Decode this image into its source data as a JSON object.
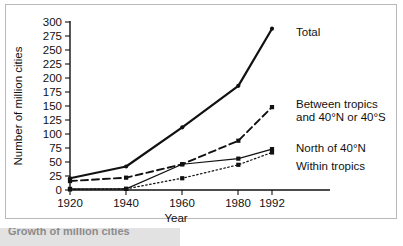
{
  "figure": {
    "caption_partial": "Growth of million cities",
    "frame_color": "#b9b9b9",
    "background": "#ffffff",
    "ink_color": "#111111"
  },
  "chart_data": {
    "type": "line",
    "title": "",
    "xlabel": "Year",
    "ylabel": "Number of million cities",
    "x": [
      1920,
      1940,
      1960,
      1980,
      1992
    ],
    "categories": [
      "1920",
      "1940",
      "1960",
      "1980",
      "1992"
    ],
    "xlim": [
      1920,
      1992
    ],
    "ylim": [
      0,
      300
    ],
    "yticks": [
      0,
      25,
      50,
      75,
      100,
      125,
      150,
      175,
      200,
      225,
      250,
      275,
      300
    ],
    "ytick_labels": [
      "0",
      "25",
      "50",
      "75",
      "100",
      "125",
      "150",
      "175",
      "200",
      "225",
      "250",
      "275",
      "300"
    ],
    "xticks": [
      1920,
      1940,
      1960,
      1980,
      1992
    ],
    "xtick_labels": [
      "1920",
      "1940",
      "1960",
      "1980",
      "1992"
    ],
    "grid": false,
    "legend": "inline-right-labels",
    "series": [
      {
        "name": "Total",
        "label": "Total",
        "style": "solid-thick",
        "marker": "dot",
        "values": [
          21,
          42,
          112,
          186,
          288
        ]
      },
      {
        "name": "Between tropics and 40°N or 40°S",
        "label_line1": "Between tropics",
        "label_line2": "and 40°N or 40°S",
        "style": "dashed",
        "marker": "square",
        "values": [
          16,
          22,
          46,
          88,
          148
        ]
      },
      {
        "name": "North of 40°N",
        "label": "North of 40°N",
        "style": "solid-thin",
        "marker": "square",
        "values": [
          2,
          2,
          46,
          56,
          73
        ]
      },
      {
        "name": "Within tropics",
        "label": "Within tropics",
        "style": "dotted",
        "marker": "square",
        "values": [
          1,
          2,
          21,
          45,
          67
        ]
      }
    ]
  }
}
